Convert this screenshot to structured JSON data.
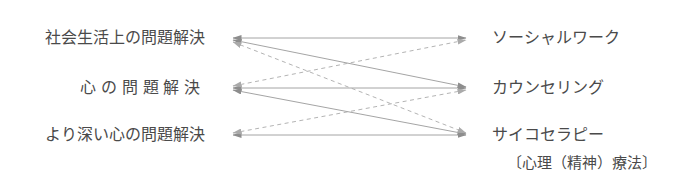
{
  "figure": {
    "title": "",
    "background_color": "#ffffff",
    "text_color": "#4a4a4a",
    "width": 676,
    "height": 196
  },
  "left_column": {
    "items": [
      {
        "label": "社会生活上の問題解決"
      },
      {
        "label": "心の問題解決"
      },
      {
        "label": "より深い心の問題解決"
      }
    ]
  },
  "right_column": {
    "items": [
      {
        "label": "ソーシャルワーク",
        "sublabel": ""
      },
      {
        "label": "カウンセリング",
        "sublabel": ""
      },
      {
        "label": "サイコセラピー",
        "sublabel": "〔心理（精神）療法〕"
      }
    ]
  },
  "edges": {
    "solid_color": "#8d8d8d",
    "dashed_color": "#b0b0b0",
    "legend": {
      "solid_meaning": "",
      "dashed_meaning": ""
    },
    "connections": [
      {
        "from": 0,
        "to": 0,
        "style": "solid"
      },
      {
        "from": 0,
        "to": 1,
        "style": "solid"
      },
      {
        "from": 0,
        "to": 2,
        "style": "solid"
      },
      {
        "from": 1,
        "to": 1,
        "style": "solid"
      },
      {
        "from": 1,
        "to": 2,
        "style": "solid"
      },
      {
        "from": 2,
        "to": 2,
        "style": "solid"
      },
      {
        "from": 1,
        "to": 0,
        "style": "dashed"
      },
      {
        "from": 2,
        "to": 0,
        "style": "dashed"
      },
      {
        "from": 2,
        "to": 1,
        "style": "dashed"
      }
    ]
  },
  "geometry": {
    "left_x": 225,
    "right_x": 474,
    "row_y": [
      38,
      88,
      135
    ]
  }
}
